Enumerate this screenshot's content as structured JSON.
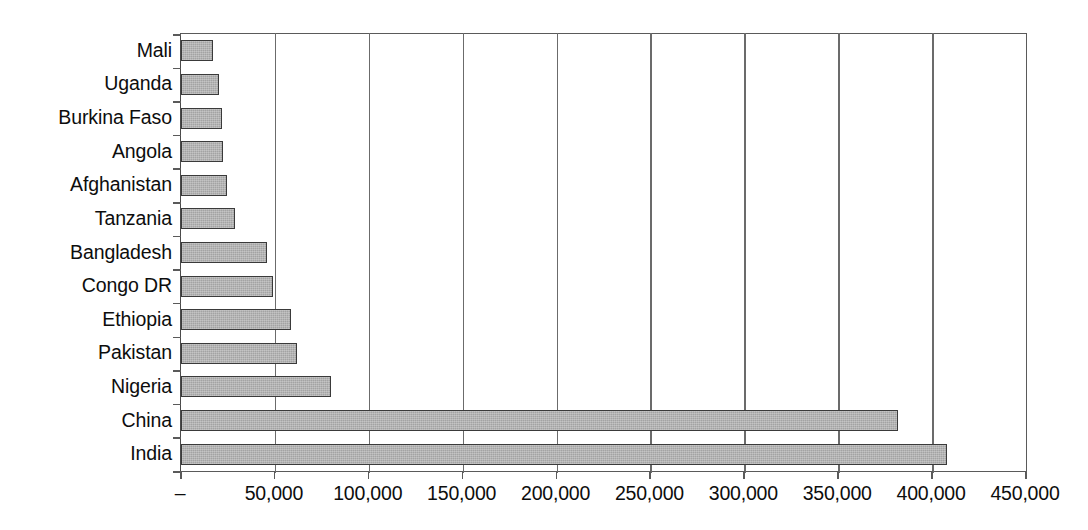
{
  "chart_data": {
    "type": "bar",
    "orientation": "horizontal",
    "title": "",
    "subtitle": "",
    "xlabel": "",
    "ylabel": "",
    "categories": [
      "Mali",
      "Uganda",
      "Burkina Faso",
      "Angola",
      "Afghanistan",
      "Tanzania",
      "Bangladesh",
      "Congo DR",
      "Ethiopia",
      "Pakistan",
      "Nigeria",
      "China",
      "India"
    ],
    "values": [
      17000,
      20500,
      22000,
      22500,
      24500,
      28500,
      46000,
      49000,
      58500,
      62000,
      80000,
      382000,
      408000
    ],
    "series": [
      {
        "name": "",
        "values": [
          17000,
          20500,
          22000,
          22500,
          24500,
          28500,
          46000,
          49000,
          58500,
          62000,
          80000,
          382000,
          408000
        ]
      }
    ],
    "xlim": [
      0,
      450000
    ],
    "xticks": [
      0,
      50000,
      100000,
      150000,
      200000,
      250000,
      300000,
      350000,
      400000,
      450000
    ],
    "xticklabels": [
      "–",
      "50,000",
      "100,000",
      "150,000",
      "200,000",
      "250,000",
      "300,000",
      "350,000",
      "400,000",
      "450,000"
    ],
    "grid": true,
    "grid_axis": "x",
    "legend": false,
    "legend_position": "none",
    "bar_color": "#a3a3a3",
    "bar_edge_color": "#3a3a3a",
    "axis_color": "#5a5a5a",
    "background_color": "#ffffff",
    "annotations": []
  }
}
